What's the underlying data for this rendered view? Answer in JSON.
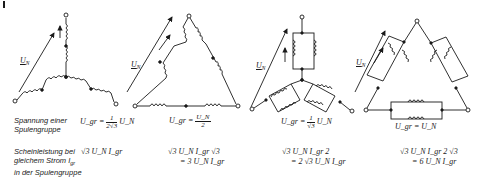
{
  "figure": {
    "corner_mark": "|",
    "voltage_symbol": "U",
    "voltage_subscript": "N",
    "group_subscript": "gr",
    "current_symbol": "I"
  },
  "row_labels": {
    "voltage": [
      "Spannung einer",
      "Spulengruppe"
    ],
    "power": [
      "Scheinleistung bei",
      "gleichem Strom I",
      "in der Spulengruppe"
    ],
    "power_current_subscript": "gr"
  },
  "circuits": [
    {
      "id": "star-series",
      "topology": "star, series coils",
      "arrow_label": "U_N",
      "voltage_formula": {
        "lhs": "U_gr =",
        "num": "1",
        "den": "2√3",
        "rhs": "U_N"
      },
      "power_formula": {
        "line1": "√3 U_N I_gr",
        "line2": ""
      }
    },
    {
      "id": "delta-series",
      "topology": "delta, series coils",
      "arrow_label": "U_N",
      "voltage_formula": {
        "lhs": "U_gr =",
        "num": "U_N",
        "den": "2",
        "rhs": ""
      },
      "power_formula": {
        "line1": "√3 U_N I_gr √3",
        "line2": "= 3 U_N I_gr"
      }
    },
    {
      "id": "star-parallel",
      "topology": "star, parallel coils",
      "arrow_label": "U_N",
      "voltage_formula": {
        "lhs": "U_gr =",
        "num": "1",
        "den": "√3",
        "rhs": "U_N"
      },
      "power_formula": {
        "line1": "√3 U_N I_gr 2",
        "line2": "= 2 √3 U_N I_gr"
      }
    },
    {
      "id": "delta-parallel",
      "topology": "delta, parallel coils",
      "arrow_label": "U_N",
      "voltage_formula": {
        "lhs": "U_gr = U_N",
        "num": "",
        "den": "",
        "rhs": ""
      },
      "power_formula": {
        "line1": "√3 U_N I_gr 2 √3",
        "line2": "= 6 U_N I_gr"
      }
    }
  ]
}
